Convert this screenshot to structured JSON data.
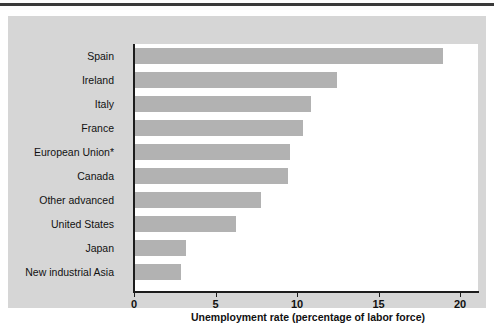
{
  "chart_data": {
    "type": "bar",
    "orientation": "horizontal",
    "title": "",
    "xlabel": "Unemployment rate (percentage of labor force)",
    "ylabel": "",
    "xlim": [
      0,
      21.2
    ],
    "xticks": [
      0,
      5,
      10,
      15,
      20
    ],
    "xtick_labels": [
      "0",
      "5",
      "10",
      "15",
      "20"
    ],
    "grid": false,
    "legend": false,
    "bar_color": "#b2b2b2",
    "categories": [
      "Spain",
      "Ireland",
      "Italy",
      "France",
      "European Union*",
      "Canada",
      "Other advanced",
      "United States",
      "Japan",
      "New industrial Asia"
    ],
    "values": [
      18.9,
      12.4,
      10.8,
      10.3,
      9.5,
      9.4,
      7.7,
      6.2,
      3.1,
      2.8
    ]
  },
  "figure": {
    "panel_color": "#d6d6d6",
    "plot_background": "#ffffff",
    "axis_color": "#1c1c1c",
    "rule_color": "#3a3a3a"
  }
}
